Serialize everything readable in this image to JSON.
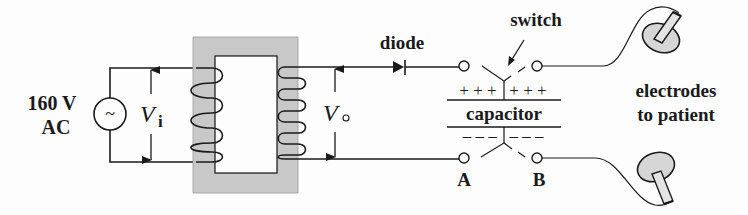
{
  "diagram": {
    "source": {
      "voltage_label": "160 V",
      "type_label": "AC",
      "symbol": "~"
    },
    "labels": {
      "input_voltage": "V",
      "input_voltage_sub": "i",
      "output_voltage": "V",
      "output_voltage_sub": "o",
      "diode": "diode",
      "switch": "switch",
      "capacitor": "capacitor",
      "capacitor_positive": "+ + +   + + +",
      "capacitor_negative": "– – –   – – –",
      "terminal_a": "A",
      "terminal_b": "B",
      "electrodes_line1": "electrodes",
      "electrodes_line2": "to patient"
    },
    "colors": {
      "ink": "#1a1a1a",
      "core_fill": "#c8c8c8",
      "electrode_fill": "#d6d6d6",
      "background": "#fdfdfd"
    }
  }
}
